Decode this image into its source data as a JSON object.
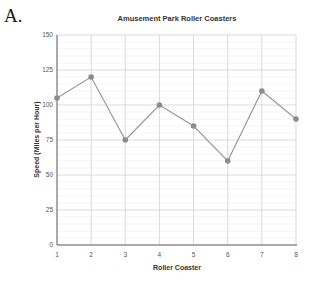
{
  "figure_label": "A.",
  "chart_data": {
    "type": "line",
    "title": "Amusement Park Roller Coasters",
    "xlabel": "Roller Coaster",
    "ylabel": "Speed (Miles per Hour)",
    "x": [
      1,
      2,
      3,
      4,
      5,
      6,
      7,
      8
    ],
    "values": [
      105,
      120,
      75,
      100,
      85,
      60,
      110,
      90
    ],
    "xlim": [
      1,
      8
    ],
    "ylim": [
      0,
      150
    ],
    "yticks": [
      0,
      25,
      50,
      75,
      100,
      125,
      150
    ],
    "xticks": [
      1,
      2,
      3,
      4,
      5,
      6,
      7,
      8
    ],
    "grid": true,
    "minor_grid": true,
    "legend": null,
    "line_color": "#9a9a9a",
    "marker_color": "#8c8c8c"
  }
}
